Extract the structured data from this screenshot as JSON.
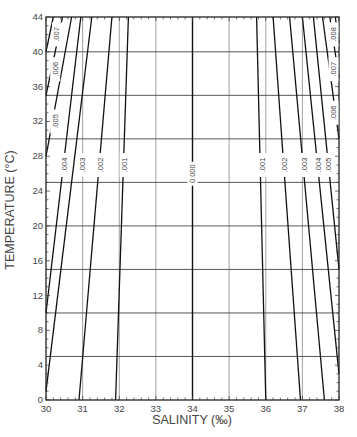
{
  "chart_data": {
    "type": "line",
    "title": "",
    "xlabel": "SALINITY (‰)",
    "ylabel": "TEMPERATURE (°C)",
    "xlim": [
      30,
      38
    ],
    "ylim": [
      0,
      44
    ],
    "x_ticks": [
      "30",
      "31",
      "32",
      "33",
      "34",
      "35",
      "36",
      "37",
      "38"
    ],
    "y_ticks": [
      "0",
      "4",
      "8",
      "12",
      "16",
      "20",
      "24",
      "28",
      "32",
      "36",
      "40",
      "44"
    ],
    "grid": {
      "vertical_every": 1,
      "horizontal_every_degC": 5
    },
    "legend": "none",
    "series": [
      {
        "name": "0.000",
        "points": [
          [
            34.0,
            0
          ],
          [
            34.0,
            44
          ]
        ]
      },
      {
        "name": ".001 (low S)",
        "points": [
          [
            31.9,
            0
          ],
          [
            32.25,
            44
          ]
        ]
      },
      {
        "name": ".002 (low S)",
        "points": [
          [
            30.9,
            0
          ],
          [
            31.8,
            44
          ]
        ]
      },
      {
        "name": ".003 (low S)",
        "points": [
          [
            30.0,
            1
          ],
          [
            31.25,
            44
          ]
        ]
      },
      {
        "name": ".004 (low S)",
        "points": [
          [
            30.0,
            10
          ],
          [
            30.95,
            44
          ]
        ]
      },
      {
        "name": ".005 (low S)",
        "points": [
          [
            30.0,
            28
          ],
          [
            30.7,
            44
          ]
        ]
      },
      {
        "name": ".006 (low S)",
        "points": [
          [
            30.0,
            35
          ],
          [
            30.45,
            44
          ]
        ]
      },
      {
        "name": ".007 (low S)",
        "points": [
          [
            30.0,
            40
          ],
          [
            30.2,
            44
          ]
        ]
      },
      {
        "name": ".001 (high S)",
        "points": [
          [
            36.0,
            0
          ],
          [
            35.75,
            44
          ]
        ]
      },
      {
        "name": ".002 (high S)",
        "points": [
          [
            36.95,
            0
          ],
          [
            36.2,
            44
          ]
        ]
      },
      {
        "name": ".003 (high S)",
        "points": [
          [
            37.6,
            0
          ],
          [
            36.65,
            44
          ]
        ]
      },
      {
        "name": ".004 (high S)",
        "points": [
          [
            38.0,
            3
          ],
          [
            37.0,
            44
          ]
        ]
      },
      {
        "name": ".005 (high S)",
        "points": [
          [
            38.0,
            15
          ],
          [
            37.3,
            44
          ]
        ]
      },
      {
        "name": ".006 (high S)",
        "points": [
          [
            38.0,
            30
          ],
          [
            37.55,
            44
          ]
        ]
      },
      {
        "name": ".007 (high S)",
        "points": [
          [
            38.0,
            37
          ],
          [
            37.75,
            44
          ]
        ]
      },
      {
        "name": ".008 (high S)",
        "points": [
          [
            38.0,
            41
          ],
          [
            37.9,
            44
          ]
        ]
      }
    ],
    "contour_labels": [
      {
        "text": "0.000",
        "s": 34.0,
        "t": 26
      },
      {
        "text": ".001",
        "s": 32.15,
        "t": 27
      },
      {
        "text": ".002",
        "s": 31.5,
        "t": 27
      },
      {
        "text": ".003",
        "s": 31.0,
        "t": 27
      },
      {
        "text": ".004",
        "s": 30.5,
        "t": 27
      },
      {
        "text": ".005",
        "s": 30.25,
        "t": 32
      },
      {
        "text": ".006",
        "s": 30.25,
        "t": 38
      },
      {
        "text": ".007",
        "s": 30.3,
        "t": 42
      },
      {
        "text": ".001",
        "s": 35.9,
        "t": 27
      },
      {
        "text": ".002",
        "s": 36.5,
        "t": 27
      },
      {
        "text": ".003",
        "s": 37.05,
        "t": 27
      },
      {
        "text": ".004",
        "s": 37.45,
        "t": 27
      },
      {
        "text": ".005",
        "s": 37.7,
        "t": 27
      },
      {
        "text": ".006",
        "s": 37.85,
        "t": 33
      },
      {
        "text": ".007",
        "s": 37.85,
        "t": 38
      },
      {
        "text": ".008",
        "s": 37.85,
        "t": 42
      }
    ]
  }
}
